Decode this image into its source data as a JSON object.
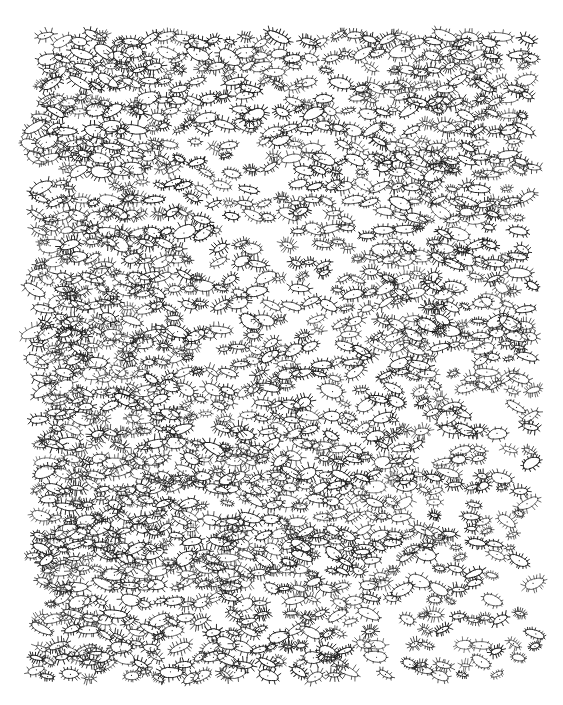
{
  "artwork": {
    "title": "Field of Eye Motifs",
    "medium": "black ink pen on white paper",
    "domain_note": "natural-image scan of a hand-drawn abstract pattern drawing",
    "canvas": {
      "width": 563,
      "height": 705,
      "background_color": "#ffffff"
    },
    "ink": {
      "color": "#1a1a1a",
      "secondary_color": "#3d3d3d",
      "stroke_width_min": 0.55,
      "stroke_width_max": 0.95
    },
    "drawn_region": {
      "left": 33,
      "top": 34,
      "right": 533,
      "bottom": 681,
      "margin_note": "white unmarked paper margin on all four sides"
    },
    "motif": {
      "name": "eye-cilia-oval",
      "description": "small elongated ellipse outline with short radiating hatch strokes around the perimeter and a tiny dot at the center",
      "count_estimate": 960,
      "width_min": 8,
      "width_max": 23,
      "aspect_ratio_min": 1.7,
      "aspect_ratio_max": 3.2,
      "lash_count_min": 9,
      "lash_count_max": 18,
      "lash_length_min": 1.8,
      "lash_length_max": 4.6,
      "rotation_deg_min": -34,
      "rotation_deg_max": 34,
      "center_dot_radius": 0.6,
      "has_center_dot": true
    },
    "layout": {
      "arrangement": "loose quasi-horizontal rows with irregular jitter",
      "row_count_estimate": 46,
      "row_spacing_avg": 14.2,
      "column_spacing_avg": 20.5
    },
    "density_map": {
      "note": "relative motif density / ink darkness across the sheet, 0 = blank, 1 = densest",
      "cols": 6,
      "rows": 6,
      "grid": [
        [
          0.88,
          0.84,
          0.8,
          0.78,
          0.86,
          0.82
        ],
        [
          0.92,
          0.86,
          0.74,
          0.76,
          0.88,
          0.84
        ],
        [
          0.94,
          0.9,
          0.7,
          0.72,
          0.86,
          0.8
        ],
        [
          0.96,
          0.94,
          0.88,
          0.82,
          0.78,
          0.68
        ],
        [
          0.93,
          0.92,
          0.86,
          0.84,
          0.74,
          0.62
        ],
        [
          0.88,
          0.86,
          0.82,
          0.8,
          0.7,
          0.55
        ]
      ]
    },
    "regions": [
      {
        "name": "upper-left-dense",
        "x": 33,
        "y": 34,
        "w": 170,
        "h": 150,
        "density": 0.9
      },
      {
        "name": "upper-middle-light",
        "x": 203,
        "y": 34,
        "w": 160,
        "h": 150,
        "density": 0.76
      },
      {
        "name": "upper-right-medium",
        "x": 363,
        "y": 34,
        "w": 170,
        "h": 150,
        "density": 0.84
      },
      {
        "name": "mid-left-darkest",
        "x": 33,
        "y": 280,
        "w": 170,
        "h": 180,
        "density": 0.96
      },
      {
        "name": "center-band",
        "x": 203,
        "y": 280,
        "w": 160,
        "h": 180,
        "density": 0.88
      },
      {
        "name": "mid-right-fading",
        "x": 363,
        "y": 280,
        "w": 170,
        "h": 180,
        "density": 0.74
      },
      {
        "name": "lower-left-dense",
        "x": 33,
        "y": 520,
        "w": 170,
        "h": 161,
        "density": 0.88
      },
      {
        "name": "lower-middle",
        "x": 203,
        "y": 520,
        "w": 160,
        "h": 161,
        "density": 0.8
      },
      {
        "name": "lower-right-sparse",
        "x": 363,
        "y": 520,
        "w": 170,
        "h": 161,
        "density": 0.58
      }
    ],
    "seed": 20240917
  }
}
